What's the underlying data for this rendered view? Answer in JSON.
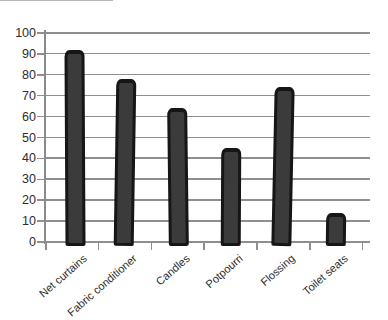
{
  "chart_data": {
    "type": "bar",
    "title": "",
    "xlabel": "",
    "ylabel": "",
    "categories": [
      "Net curtains",
      "Fabric conditioner",
      "Candles",
      "Potpourri",
      "Flossing",
      "Toilet seats"
    ],
    "values": [
      92,
      78,
      64,
      45,
      74,
      14
    ],
    "ylim": [
      0,
      100
    ],
    "yticks": [
      0,
      10,
      20,
      30,
      40,
      50,
      60,
      70,
      80,
      90,
      100
    ],
    "grid": "horizontal",
    "legend_position": "none",
    "style": "hand-drawn scanned print chart",
    "colors": {
      "bar_fill": "#3b3b3b",
      "bar_outline": "#161616",
      "gridline": "#8f8f8f",
      "axis": "#8a8a8a",
      "text": "#2d2d2d",
      "background": "#ffffff"
    }
  }
}
